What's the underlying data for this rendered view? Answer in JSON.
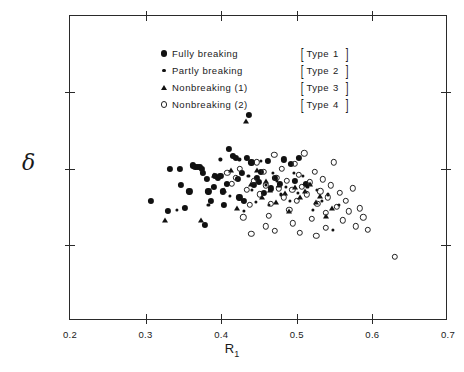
{
  "chart_data": {
    "type": "scatter",
    "title": "",
    "xlabel": "R1",
    "ylabel": "δ",
    "xlim": [
      0.2,
      0.7
    ],
    "ylim": [
      0.0,
      0.2
    ],
    "xticks": [
      "0.2",
      "0.3",
      "0.4",
      "0.5",
      "0.6",
      "0.7"
    ],
    "xtick_values": [
      0.2,
      0.3,
      0.4,
      0.5,
      0.6,
      0.7
    ],
    "yticks": [
      "0",
      "0.05",
      "0.1",
      "0.15",
      "0.2"
    ],
    "ytick_values": [
      0.0,
      0.05,
      0.1,
      0.15,
      0.2
    ],
    "grid": false,
    "legend_position": "top-left-inside",
    "series": [
      {
        "name": "Fully breaking",
        "type_label": "Type 1",
        "marker": "filled-circle",
        "points": [
          [
            0.307,
            0.079
          ],
          [
            0.33,
            0.072
          ],
          [
            0.332,
            0.1
          ],
          [
            0.345,
            0.1
          ],
          [
            0.347,
            0.089
          ],
          [
            0.352,
            0.074
          ],
          [
            0.358,
            0.085
          ],
          [
            0.363,
            0.102
          ],
          [
            0.366,
            0.101
          ],
          [
            0.369,
            0.101
          ],
          [
            0.372,
            0.101
          ],
          [
            0.374,
            0.1
          ],
          [
            0.376,
            0.097
          ],
          [
            0.378,
            0.063
          ],
          [
            0.381,
            0.093
          ],
          [
            0.383,
            0.085
          ],
          [
            0.386,
            0.079
          ],
          [
            0.39,
            0.088
          ],
          [
            0.392,
            0.095
          ],
          [
            0.396,
            0.094
          ],
          [
            0.399,
            0.095
          ],
          [
            0.402,
            0.085
          ],
          [
            0.404,
            0.076
          ],
          [
            0.408,
            0.09
          ],
          [
            0.41,
            0.113
          ],
          [
            0.415,
            0.108
          ],
          [
            0.419,
            0.107
          ],
          [
            0.422,
            0.093
          ],
          [
            0.424,
            0.081
          ],
          [
            0.427,
            0.097
          ],
          [
            0.43,
            0.079
          ],
          [
            0.434,
            0.107
          ],
          [
            0.437,
            0.135
          ],
          [
            0.44,
            0.104
          ],
          [
            0.443,
            0.089
          ],
          [
            0.447,
            0.094
          ],
          [
            0.45,
            0.091
          ],
          [
            0.453,
            0.098
          ],
          [
            0.457,
            0.084
          ],
          [
            0.462,
            0.105
          ],
          [
            0.466,
            0.087
          ],
          [
            0.471,
            0.094
          ],
          [
            0.478,
            0.09
          ],
          [
            0.483,
            0.106
          ],
          [
            0.492,
            0.103
          ],
          [
            0.497,
            0.092
          ],
          [
            0.503,
            0.107
          ],
          [
            0.512,
            0.09
          ]
        ]
      },
      {
        "name": "Partly breaking",
        "type_label": "Type 2",
        "marker": "small-dot",
        "points": [
          [
            0.341,
            0.073
          ],
          [
            0.383,
            0.076
          ],
          [
            0.399,
            0.106
          ],
          [
            0.412,
            0.082
          ],
          [
            0.424,
            0.106
          ],
          [
            0.43,
            0.072
          ],
          [
            0.436,
            0.095
          ],
          [
            0.441,
            0.086
          ],
          [
            0.446,
            0.078
          ],
          [
            0.452,
            0.105
          ],
          [
            0.459,
            0.089
          ],
          [
            0.463,
            0.076
          ],
          [
            0.468,
            0.097
          ],
          [
            0.474,
            0.092
          ],
          [
            0.479,
            0.083
          ],
          [
            0.486,
            0.088
          ],
          [
            0.491,
            0.079
          ],
          [
            0.496,
            0.097
          ],
          [
            0.502,
            0.084
          ],
          [
            0.508,
            0.095
          ],
          [
            0.514,
            0.088
          ],
          [
            0.521,
            0.073
          ],
          [
            0.527,
            0.086
          ],
          [
            0.533,
            0.079
          ],
          [
            0.541,
            0.083
          ],
          [
            0.548,
            0.06
          ],
          [
            0.556,
            0.076
          ]
        ]
      },
      {
        "name": "Nonbreaking (1)",
        "type_label": "Type 3",
        "marker": "triangle",
        "points": [
          [
            0.326,
            0.066
          ],
          [
            0.373,
            0.066
          ],
          [
            0.39,
            0.096
          ],
          [
            0.404,
            0.086
          ],
          [
            0.413,
            0.099
          ],
          [
            0.421,
            0.074
          ],
          [
            0.433,
            0.131
          ],
          [
            0.439,
            0.09
          ],
          [
            0.447,
            0.099
          ],
          [
            0.454,
            0.081
          ],
          [
            0.459,
            0.092
          ],
          [
            0.465,
            0.086
          ],
          [
            0.472,
            0.078
          ],
          [
            0.477,
            0.089
          ],
          [
            0.484,
            0.084
          ],
          [
            0.49,
            0.072
          ],
          [
            0.497,
            0.088
          ],
          [
            0.504,
            0.081
          ],
          [
            0.511,
            0.085
          ],
          [
            0.518,
            0.09
          ],
          [
            0.525,
            0.078
          ],
          [
            0.531,
            0.082
          ],
          [
            0.539,
            0.069
          ],
          [
            0.546,
            0.074
          ]
        ]
      },
      {
        "name": "Nonbreaking (2)",
        "type_label": "Type 4",
        "marker": "open-circle",
        "points": [
          [
            0.408,
            0.097
          ],
          [
            0.414,
            0.09
          ],
          [
            0.419,
            0.094
          ],
          [
            0.425,
            0.1
          ],
          [
            0.429,
            0.068
          ],
          [
            0.434,
            0.086
          ],
          [
            0.438,
            0.076
          ],
          [
            0.443,
            0.092
          ],
          [
            0.447,
            0.104
          ],
          [
            0.451,
            0.083
          ],
          [
            0.456,
            0.098
          ],
          [
            0.459,
            0.089
          ],
          [
            0.463,
            0.069
          ],
          [
            0.466,
            0.077
          ],
          [
            0.47,
            0.109
          ],
          [
            0.473,
            0.094
          ],
          [
            0.476,
            0.087
          ],
          [
            0.48,
            0.1
          ],
          [
            0.483,
            0.081
          ],
          [
            0.487,
            0.092
          ],
          [
            0.49,
            0.073
          ],
          [
            0.494,
            0.086
          ],
          [
            0.497,
            0.103
          ],
          [
            0.5,
            0.079
          ],
          [
            0.503,
            0.096
          ],
          [
            0.507,
            0.088
          ],
          [
            0.51,
            0.11
          ],
          [
            0.513,
            0.083
          ],
          [
            0.517,
            0.091
          ],
          [
            0.52,
            0.067
          ],
          [
            0.524,
            0.098
          ],
          [
            0.527,
            0.077
          ],
          [
            0.531,
            0.085
          ],
          [
            0.534,
            0.093
          ],
          [
            0.538,
            0.071
          ],
          [
            0.541,
            0.081
          ],
          [
            0.545,
            0.089
          ],
          [
            0.549,
            0.104
          ],
          [
            0.553,
            0.075
          ],
          [
            0.557,
            0.084
          ],
          [
            0.561,
            0.066
          ],
          [
            0.565,
            0.079
          ],
          [
            0.569,
            0.072
          ],
          [
            0.574,
            0.087
          ],
          [
            0.578,
            0.062
          ],
          [
            0.583,
            0.074
          ],
          [
            0.588,
            0.068
          ],
          [
            0.594,
            0.06
          ],
          [
            0.44,
            0.057
          ],
          [
            0.459,
            0.062
          ],
          [
            0.471,
            0.059
          ],
          [
            0.495,
            0.064
          ],
          [
            0.504,
            0.058
          ],
          [
            0.526,
            0.056
          ],
          [
            0.538,
            0.061
          ],
          [
            0.63,
            0.042
          ]
        ]
      }
    ]
  },
  "legend": {
    "entries": [
      {
        "label": "Fully  breaking",
        "bracket_open": "[",
        "type_word": "Type",
        "type_num": "1",
        "bracket_close": "]"
      },
      {
        "label": "Partly  breaking",
        "bracket_open": "[",
        "type_word": "Type",
        "type_num": "2",
        "bracket_close": "]"
      },
      {
        "label": "Nonbreaking (1)",
        "bracket_open": "[",
        "type_word": "Type",
        "type_num": "3",
        "bracket_close": "]"
      },
      {
        "label": "Nonbreaking (2)",
        "bracket_open": "[",
        "type_word": "Type",
        "type_num": "4",
        "bracket_close": "]"
      }
    ]
  },
  "axes": {
    "y_title": "δ",
    "x_title_main": "R",
    "x_title_sub": "1"
  }
}
